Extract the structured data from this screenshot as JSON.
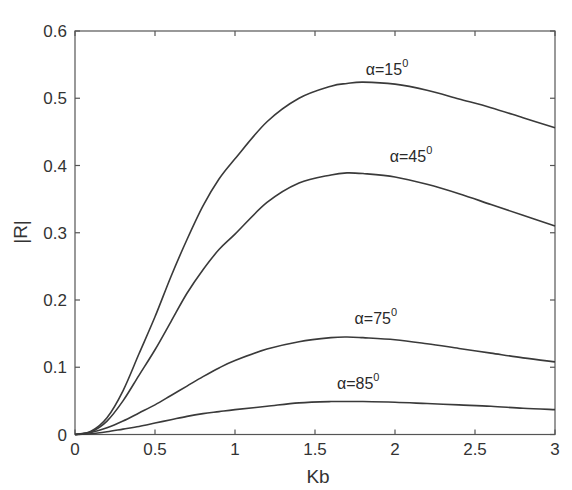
{
  "chart_data": {
    "type": "line",
    "title": "",
    "xlabel": "Kb",
    "ylabel": "|R|",
    "xlim": [
      0,
      3
    ],
    "ylim": [
      0,
      0.6
    ],
    "grid": false,
    "legend": "none (inline curve annotations)",
    "x_ticks": [
      0,
      0.5,
      1,
      1.5,
      2,
      2.5,
      3
    ],
    "x_tick_labels": [
      "0",
      "0.5",
      "1",
      "1.5",
      "2",
      "2.5",
      "3"
    ],
    "y_ticks": [
      0,
      0.1,
      0.2,
      0.3,
      0.4,
      0.5,
      0.6
    ],
    "y_tick_labels": [
      "0",
      "0.1",
      "0.2",
      "0.3",
      "0.4",
      "0.5",
      "0.6"
    ],
    "x": [
      0,
      0.1,
      0.2,
      0.3,
      0.4,
      0.5,
      0.6,
      0.7,
      0.8,
      0.9,
      1.0,
      1.2,
      1.4,
      1.6,
      1.7,
      1.8,
      2.0,
      2.2,
      2.4,
      2.6,
      2.8,
      3.0
    ],
    "series": [
      {
        "name": "α=15°",
        "label_main": "α=15",
        "label_sup": "0",
        "label_pos": [
          1.95,
          0.535
        ],
        "values": [
          0,
          0.005,
          0.025,
          0.065,
          0.12,
          0.175,
          0.235,
          0.29,
          0.34,
          0.38,
          0.41,
          0.465,
          0.5,
          0.518,
          0.522,
          0.524,
          0.521,
          0.512,
          0.499,
          0.486,
          0.471,
          0.456
        ]
      },
      {
        "name": "α=45°",
        "label_main": "α=45",
        "label_sup": "0",
        "label_pos": [
          2.1,
          0.405
        ],
        "values": [
          0,
          0.004,
          0.02,
          0.05,
          0.088,
          0.126,
          0.168,
          0.21,
          0.245,
          0.275,
          0.298,
          0.345,
          0.374,
          0.386,
          0.389,
          0.388,
          0.383,
          0.372,
          0.358,
          0.342,
          0.326,
          0.31
        ]
      },
      {
        "name": "α=75°",
        "label_main": "α=75",
        "label_sup": "0",
        "label_pos": [
          1.88,
          0.165
        ],
        "values": [
          0,
          0.003,
          0.01,
          0.02,
          0.032,
          0.044,
          0.058,
          0.072,
          0.086,
          0.099,
          0.11,
          0.127,
          0.138,
          0.144,
          0.145,
          0.144,
          0.141,
          0.135,
          0.128,
          0.121,
          0.114,
          0.108
        ]
      },
      {
        "name": "α=85°",
        "label_main": "α=85",
        "label_sup": "0",
        "label_pos": [
          1.77,
          0.068
        ],
        "values": [
          0,
          0.001,
          0.004,
          0.008,
          0.012,
          0.017,
          0.022,
          0.027,
          0.031,
          0.034,
          0.037,
          0.042,
          0.047,
          0.049,
          0.049,
          0.049,
          0.048,
          0.046,
          0.044,
          0.042,
          0.039,
          0.037
        ]
      }
    ],
    "colors": {
      "curve": "#3a3a3a",
      "axes": "#555555",
      "background": "#ffffff"
    }
  }
}
